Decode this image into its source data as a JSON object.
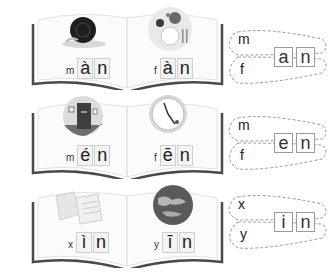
{
  "rows": [
    {
      "left": {
        "picture": "snail-icon",
        "initial": "m",
        "vowel": "à",
        "final_letter": "n"
      },
      "right": {
        "picture": "meal-plate-icon",
        "initial": "f",
        "vowel": "à",
        "final_letter": "n"
      },
      "combiner": {
        "initial_top": "m",
        "initial_bottom": "f",
        "final_boxes": [
          "a",
          "n"
        ]
      }
    },
    {
      "left": {
        "picture": "door-icon",
        "initial": "m",
        "vowel": "é",
        "final_letter": "n"
      },
      "right": {
        "picture": "clock-icon",
        "initial": "f",
        "vowel": "ē",
        "final_letter": "n"
      },
      "combiner": {
        "initial_top": "m",
        "initial_bottom": "f",
        "final_boxes": [
          "e",
          "n"
        ]
      }
    },
    {
      "left": {
        "picture": "letters-paper-icon",
        "initial": "x",
        "vowel": "ì",
        "final_letter": "n"
      },
      "right": {
        "picture": "globe-icon",
        "initial": "y",
        "vowel": "ī",
        "final_letter": "n"
      },
      "combiner": {
        "initial_top": "x",
        "initial_bottom": "y",
        "final_boxes": [
          "i",
          "n"
        ]
      }
    }
  ]
}
